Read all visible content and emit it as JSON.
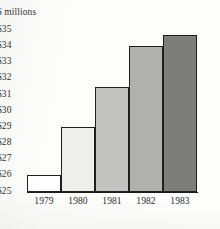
{
  "chart_data": {
    "type": "bar",
    "title": "",
    "subtitle": "",
    "unit_caption": "$ millions",
    "xlabel": "",
    "ylabel": "",
    "categories": [
      "1979",
      "1980",
      "1981",
      "1982",
      "1983"
    ],
    "values": [
      26.0,
      29.0,
      31.5,
      34.0,
      34.7
    ],
    "series": [
      {
        "name": "Revenue",
        "values": [
          26.0,
          29.0,
          31.5,
          34.0,
          34.7
        ]
      }
    ],
    "ylim": [
      25,
      35
    ],
    "ytick_labels": [
      "$35",
      "$34",
      "$33",
      "$32",
      "$31",
      "$30",
      "$29",
      "$28",
      "$27",
      "$26",
      "$25"
    ],
    "ytick_values": [
      35,
      34,
      33,
      32,
      31,
      30,
      29,
      28,
      27,
      26,
      25
    ],
    "grid": false,
    "legend": false,
    "legend_position": "none",
    "bar_fills": [
      "#ffffff",
      "#eeeeec",
      "#c2c2c0",
      "#b0b0ae",
      "#7d7d7b"
    ],
    "bar_border_color": "#1f1f1f",
    "axis_color": "#1c1c1c",
    "text_color": "#2b2b2b",
    "background_color": "#fdfdfc"
  }
}
